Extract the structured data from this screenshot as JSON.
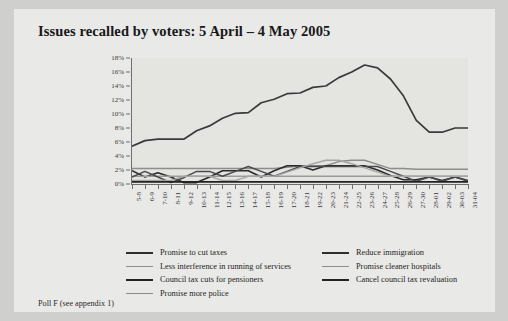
{
  "title": "Issues recalled by voters: 5 April – 4 May 2005",
  "footer": "Poll F (see appendix 1)",
  "chart_data": {
    "type": "line",
    "title": "Issues recalled by voters: 5 April – 4 May 2005",
    "xlabel": "",
    "ylabel": "",
    "ylim": [
      0,
      18
    ],
    "ytick_labels": [
      "0%",
      "2%",
      "4%",
      "6%",
      "8%",
      "10%",
      "12%",
      "14%",
      "16%",
      "18%"
    ],
    "ytick_values": [
      0,
      2,
      4,
      6,
      8,
      10,
      12,
      14,
      16,
      18
    ],
    "grid": false,
    "legend_position": "bottom",
    "categories": [
      "5-8",
      "6-9",
      "7-10",
      "8-11",
      "9-12",
      "10-13",
      "11-14",
      "12-15",
      "13-16",
      "14-17",
      "15-18",
      "16-19",
      "17-20",
      "18-21",
      "19-22",
      "20-23",
      "21-24",
      "22-25",
      "23-26",
      "24-27",
      "25-28",
      "26-29",
      "27-30",
      "28-01",
      "29-02",
      "30-03",
      "31-04"
    ],
    "series": [
      {
        "name": "Promise to cut taxes",
        "color": "#3a3a3c",
        "width": 1.7,
        "values": [
          5.4,
          6.2,
          6.4,
          6.4,
          6.4,
          7.6,
          8.3,
          9.4,
          10.1,
          10.2,
          11.6,
          12.1,
          12.9,
          13.0,
          13.8,
          14.0,
          15.2,
          16.0,
          17.0,
          16.6,
          15.0,
          12.6,
          9.1,
          7.4,
          7.4,
          8.0,
          8.0
        ]
      },
      {
        "name": "Less interference in running of services",
        "color": "#8d8d8c",
        "width": 1.5,
        "values": [
          2.2,
          2.2,
          2.2,
          2.2,
          2.2,
          2.2,
          2.2,
          2.2,
          2.2,
          2.2,
          2.2,
          2.2,
          2.4,
          2.6,
          2.6,
          2.6,
          3.2,
          3.4,
          3.4,
          2.8,
          2.2,
          2.2,
          2.1,
          2.1,
          2.1,
          2.1,
          2.1
        ]
      },
      {
        "name": "Council tax cuts for pensioners",
        "color": "#2b2b2d",
        "width": 1.6,
        "values": [
          1.9,
          1.0,
          1.6,
          1.0,
          0.2,
          0.2,
          1.0,
          1.9,
          1.9,
          1.9,
          1.0,
          1.9,
          2.6,
          2.6,
          2.0,
          2.6,
          2.6,
          2.6,
          2.6,
          2.0,
          1.2,
          0.6,
          0.6,
          1.0,
          0.5,
          1.0,
          0.5
        ]
      },
      {
        "name": "Promise more police",
        "color": "#9b9b99",
        "width": 1.5,
        "values": [
          1.1,
          1.1,
          1.1,
          1.1,
          1.1,
          1.1,
          1.1,
          1.1,
          1.1,
          1.1,
          1.1,
          1.1,
          1.1,
          1.1,
          1.1,
          1.1,
          1.1,
          1.1,
          1.1,
          1.1,
          1.1,
          1.1,
          1.1,
          1.1,
          1.1,
          1.1,
          1.1
        ]
      },
      {
        "name": "Reduce immigration",
        "color": "#4a4a4c",
        "width": 1.5,
        "values": [
          1.0,
          1.8,
          1.0,
          0.2,
          0.9,
          1.8,
          1.8,
          1.1,
          1.8,
          2.5,
          1.8,
          1.1,
          1.8,
          2.5,
          2.5,
          2.5,
          2.5,
          2.5,
          2.5,
          2.5,
          1.8,
          1.1,
          0.4,
          1.0,
          0.4,
          1.0,
          0.4
        ]
      },
      {
        "name": "Promise cleaner hospitals",
        "color": "#a6a6a4",
        "width": 1.4,
        "values": [
          0.5,
          0.5,
          0.5,
          0.5,
          1.1,
          1.1,
          1.1,
          0.5,
          0.5,
          1.1,
          1.1,
          1.1,
          1.7,
          2.3,
          2.9,
          3.4,
          3.4,
          2.9,
          2.3,
          1.7,
          1.1,
          1.1,
          1.1,
          1.1,
          1.1,
          1.1,
          1.1
        ]
      },
      {
        "name": "Cancel council tax revaluation",
        "color": "#222224",
        "width": 1.6,
        "values": [
          0.3,
          0.3,
          0.3,
          0.3,
          0.3,
          0.3,
          0.3,
          0.3,
          0.3,
          0.3,
          0.3,
          0.3,
          0.3,
          0.3,
          0.3,
          0.3,
          0.3,
          0.3,
          0.3,
          0.3,
          0.3,
          0.3,
          0.3,
          0.3,
          0.3,
          0.3,
          0.3
        ]
      }
    ]
  },
  "legend": {
    "left_column": [
      {
        "label": "Promise to cut taxes",
        "color": "#2e2e30",
        "width": 2.1
      },
      {
        "label": "Less interference in running of services",
        "color": "#8d8d8c",
        "width": 1.7
      },
      {
        "label": "Council tax cuts for pensioners",
        "color": "#232325",
        "width": 2.1
      },
      {
        "label": "Promise more police",
        "color": "#8a8a88",
        "width": 1.8
      }
    ],
    "right_column": [
      {
        "label": "Reduce immigration",
        "color": "#2e2e30",
        "width": 2.0
      },
      {
        "label": "Promise cleaner hospitals",
        "color": "#8d8d8c",
        "width": 1.7
      },
      {
        "label": "Cancel council tax revaluation",
        "color": "#232325",
        "width": 2.1
      }
    ]
  }
}
